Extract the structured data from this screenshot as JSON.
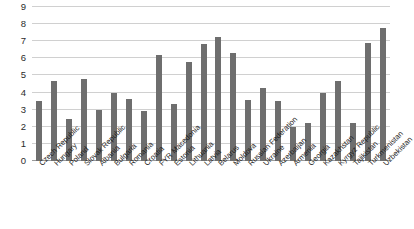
{
  "chart_data": {
    "type": "bar",
    "title": "",
    "subtitle": "",
    "xlabel": "",
    "ylabel": "",
    "ylim": [
      0,
      9
    ],
    "yticks": [
      0,
      1,
      2,
      3,
      4,
      5,
      6,
      7,
      8,
      9
    ],
    "ytick_labels": [
      "0",
      "1",
      "2",
      "3",
      "4",
      "5",
      "6",
      "7",
      "8",
      "9"
    ],
    "grid": true,
    "legend": false,
    "legend_position": "none",
    "bar_color": "#6e6e6e",
    "gridline_color": "#d0d0d0",
    "categories": [
      "Czech Republic",
      "Hungary",
      "Poland",
      "Slovak Republic",
      "Albania",
      "Bulgaria",
      "Romania",
      "Croatia",
      "FYR Macedonia",
      "Estonia",
      "Lithuania",
      "Latvia",
      "Belarus",
      "Moldova",
      "Russian Federation",
      "Ukraine",
      "Azerbaijan",
      "Armenia",
      "Georgia",
      "Kazakhstan",
      "Kyrgyz Republic",
      "Tajikistan",
      "Turkmenistan",
      "Uzbekistan"
    ],
    "values": [
      3.5,
      4.65,
      2.45,
      4.8,
      3.0,
      4.0,
      3.6,
      2.95,
      6.2,
      3.35,
      5.8,
      6.85,
      7.25,
      6.3,
      3.55,
      4.25,
      3.5,
      2.0,
      2.25,
      3.95,
      4.7,
      2.2,
      6.9,
      7.8
    ]
  }
}
